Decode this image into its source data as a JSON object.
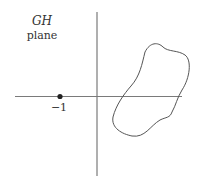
{
  "diagram": {
    "title_line1": "GH",
    "title_line2": "plane",
    "point_label": "−1",
    "point": {
      "re": -1,
      "im": 0
    },
    "colors": {
      "axis": "#7a7a7a",
      "curve": "#555555",
      "point": "#222222",
      "text": "#333333"
    }
  }
}
